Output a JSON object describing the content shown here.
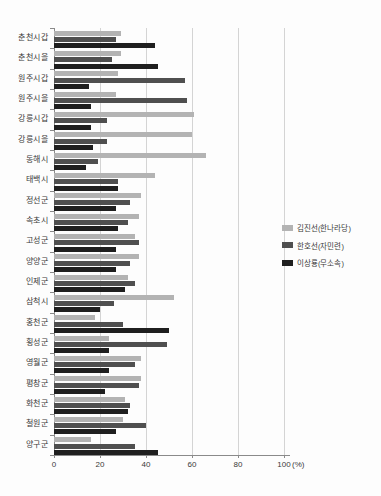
{
  "chart_data": {
    "type": "bar",
    "orientation": "horizontal",
    "title": "",
    "xlabel": "",
    "ylabel": "",
    "unit_label": "(%)",
    "xlim": [
      0,
      100
    ],
    "x_ticks": [
      0,
      20,
      40,
      60,
      80,
      100
    ],
    "grid": true,
    "legend_position": "right",
    "categories": [
      "춘천시갑",
      "춘천시을",
      "원주시갑",
      "원주시을",
      "강릉시갑",
      "강릉시을",
      "동해시",
      "태백시",
      "정선군",
      "속초시",
      "고성군",
      "양양군",
      "인제군",
      "삼척시",
      "홍천군",
      "횡성군",
      "영월군",
      "평창군",
      "화천군",
      "철원군",
      "양구군"
    ],
    "series": [
      {
        "name": "김진선(한나라당)",
        "color": "#b3b3b3",
        "values": [
          29,
          29,
          28,
          27,
          61,
          60,
          66,
          44,
          38,
          37,
          35,
          37,
          32,
          52,
          18,
          24,
          38,
          38,
          31,
          30,
          16
        ]
      },
      {
        "name": "한호선(자민련)",
        "color": "#4f4f4f",
        "values": [
          27,
          25,
          57,
          58,
          23,
          23,
          19,
          28,
          33,
          32,
          37,
          33,
          35,
          26,
          30,
          49,
          35,
          37,
          33,
          40,
          35
        ]
      },
      {
        "name": "이상룡(무소속)",
        "color": "#1f1f1f",
        "values": [
          44,
          45,
          15,
          16,
          16,
          17,
          14,
          28,
          27,
          28,
          27,
          27,
          31,
          20,
          50,
          24,
          24,
          22,
          32,
          27,
          45
        ]
      }
    ]
  },
  "colors": {
    "background": "#fdfdfd",
    "gridline": "#d4d4d4",
    "axis": "#8a8a8a",
    "text": "#3a3a3a"
  }
}
